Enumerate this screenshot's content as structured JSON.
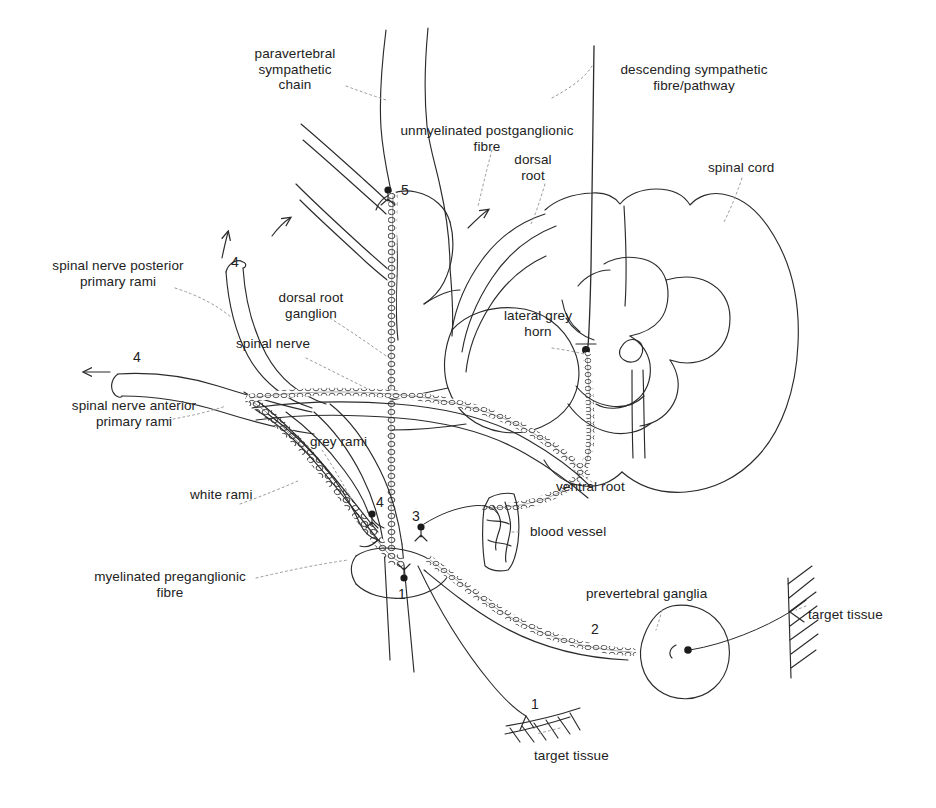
{
  "figure": {
    "ink_color": "#2b2b2b",
    "background": "#ffffff"
  },
  "labels": {
    "paravertebral_chain": "paravertebral\nsympathetic\nchain",
    "unmyelinated_postganglionic": "unmyelinated postganglionic\nfibre",
    "descending_sympathetic": "descending sympathetic\nfibre/pathway",
    "dorsal_root": "dorsal\nroot",
    "spinal_cord": "spinal cord",
    "spinal_nerve_posterior": "spinal nerve posterior\nprimary rami",
    "dorsal_root_ganglion": "dorsal root\nganglion",
    "spinal_nerve": "spinal nerve",
    "lateral_grey_horn": "lateral grey\nhorn",
    "spinal_nerve_anterior": "spinal nerve anterior\nprimary rami",
    "grey_rami": "grey rami",
    "white_rami": "white rami",
    "ventral_root": "ventral root",
    "blood_vessel": "blood vessel",
    "myelinated_preganglionic": "myelinated preganglionic\nfibre",
    "prevertebral_ganglia": "prevertebral ganglia",
    "target_tissue_right": "target tissue",
    "target_tissue_bottom": "target tissue"
  },
  "markers": {
    "m5": "5",
    "m4_upper": "4",
    "m4_left": "4",
    "m4_mid": "4",
    "m3": "3",
    "m1_junction": "1",
    "m1_bottom": "1",
    "m2": "2"
  }
}
